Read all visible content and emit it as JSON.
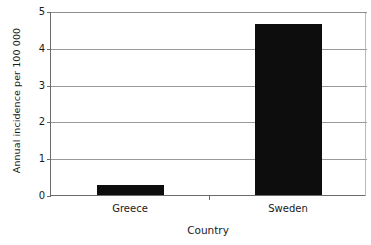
{
  "chart_data": {
    "type": "bar",
    "title": "",
    "subtitle": "",
    "categories": [
      "Greece",
      "Sweden"
    ],
    "values": [
      0.27,
      4.66
    ],
    "series": [
      {
        "name": "Annual incidence per 100 000",
        "values": [
          0.27,
          4.66
        ]
      }
    ],
    "xlabel": "Country",
    "ylabel": "Annual incidence per 100 000",
    "ylim": [
      0,
      5
    ],
    "yticks": [
      0,
      1,
      2,
      3,
      4,
      5
    ],
    "ytick_labels": [
      "0",
      "1",
      "2",
      "3",
      "4",
      "5"
    ],
    "grid": "horizontal",
    "legend": "none",
    "bar_color": "#0d0d0d",
    "gridline_color": "#9a9a9a",
    "axis_color": "#6b6b6b",
    "background_color": "#ffffff"
  }
}
